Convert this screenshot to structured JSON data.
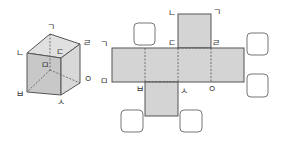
{
  "colors": {
    "face_fill": "#d4d4d4",
    "face_light": "#e2e2e2",
    "face_dark": "#c4c4c4",
    "stroke": "#555555",
    "dashed": "#555555",
    "box_stroke": "#777777"
  },
  "cube": {
    "labels": {
      "top_back_left": "ㄱ",
      "top_front_left": "ㄴ",
      "top_front_right": "ㄷ",
      "top_back_right": "ㄹ",
      "bottom_back_left": "ㅁ",
      "bottom_front_left": "ㅂ",
      "bottom_front_right": "ㅅ",
      "bottom_back_right": "ㅇ"
    }
  },
  "net": {
    "labels": {
      "top_left": "ㄴ",
      "top_right": "ㄱ",
      "mid_left": "ㄷ",
      "mid_right": "ㄹ",
      "strip_top_left": "ㄱ",
      "strip_bottom_left": "ㅁ",
      "bottom_1": "ㅂ",
      "bottom_2": "ㅅ",
      "bottom_3": "ㅇ"
    },
    "answer_boxes": [
      {
        "id": "box-top-left",
        "value": ""
      },
      {
        "id": "box-right-top",
        "value": ""
      },
      {
        "id": "box-right-bottom",
        "value": ""
      },
      {
        "id": "box-bottom-left",
        "value": ""
      },
      {
        "id": "box-bottom-right",
        "value": ""
      }
    ]
  }
}
